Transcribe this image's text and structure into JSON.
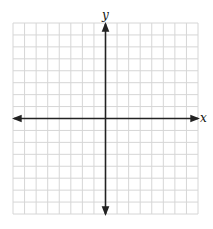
{
  "diagram": {
    "type": "coordinate-plane",
    "x_axis_label": "x",
    "y_axis_label": "y",
    "grid": {
      "columns": 16,
      "rows": 16,
      "line_color": "#d6d6d6",
      "axis_color": "#222222"
    }
  },
  "chart_data": {
    "type": "scatter",
    "title": "",
    "xlabel": "x",
    "ylabel": "y",
    "grid": true,
    "x": [],
    "y": []
  }
}
